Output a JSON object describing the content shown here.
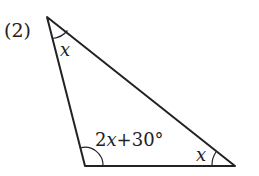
{
  "problem": {
    "number_label": "(2)"
  },
  "triangle": {
    "vertices": {
      "top": [
        47,
        17
      ],
      "bottom_left": [
        85,
        166
      ],
      "bottom_right": [
        235,
        166
      ]
    },
    "angles": {
      "top": "x",
      "bottom_left": "2x+30°",
      "bottom_right": "x"
    }
  },
  "colors": {
    "stroke": "#222222",
    "background": "#ffffff"
  }
}
